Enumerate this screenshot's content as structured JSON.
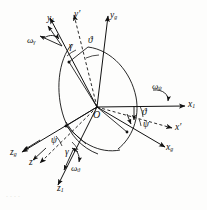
{
  "figure": {
    "domain": "diagram",
    "kind": "euler-angle-coordinate-systems",
    "background_color": "#fdfdfc",
    "ink_color": "#111111",
    "origin_label": "O",
    "bleed_text": "...."
  },
  "axes": [
    {
      "id": "y1",
      "base": "y",
      "sub": "1",
      "prime": false,
      "style": "solid",
      "group": "body",
      "label": "y"
    },
    {
      "id": "yp",
      "base": "y",
      "sub": "",
      "prime": true,
      "style": "dashed",
      "group": "intermediate",
      "label": "y"
    },
    {
      "id": "yg",
      "base": "y",
      "sub": "g",
      "prime": false,
      "style": "solid",
      "group": "ground",
      "label": "y"
    },
    {
      "id": "x1",
      "base": "x",
      "sub": "1",
      "prime": false,
      "style": "solid",
      "group": "body",
      "label": "x"
    },
    {
      "id": "xp",
      "base": "x",
      "sub": "",
      "prime": true,
      "style": "dashed",
      "group": "intermediate",
      "label": "x"
    },
    {
      "id": "xg",
      "base": "x",
      "sub": "g",
      "prime": false,
      "style": "solid",
      "group": "ground",
      "label": "x"
    },
    {
      "id": "z1",
      "base": "z",
      "sub": "1",
      "prime": false,
      "style": "solid",
      "group": "body",
      "label": "z"
    },
    {
      "id": "zp",
      "base": "z",
      "sub": "",
      "prime": true,
      "style": "dashed",
      "group": "intermediate",
      "label": "z"
    },
    {
      "id": "zg",
      "base": "z",
      "sub": "g",
      "prime": false,
      "style": "solid",
      "group": "ground",
      "label": "z"
    }
  ],
  "axis_labels": {
    "y1": "y",
    "y1_sub": "1",
    "yp": "y′",
    "yp_sub": "",
    "yg": "y",
    "yg_sub": "g",
    "x1": "x",
    "x1_sub": "1",
    "xp": "x′",
    "xp_sub": "",
    "xg": "x",
    "xg_sub": "g",
    "z1": "z",
    "z1_sub": "1",
    "zp": "z′",
    "zp_sub": "",
    "zg": "z",
    "zg_sub": "g"
  },
  "angular_velocities": [
    {
      "id": "omega_gamma",
      "symbol": "ω",
      "sub": "γ",
      "about": "y1",
      "position": "upper-left"
    },
    {
      "id": "omega_psi",
      "symbol": "ω",
      "sub": "ψ",
      "about": "x1",
      "position": "right"
    },
    {
      "id": "omega_theta",
      "symbol": "ω",
      "sub": "ϑ",
      "about": "z1",
      "position": "lower-left"
    }
  ],
  "omega_labels": {
    "gamma": {
      "symbol": "ω",
      "sub": "γ"
    },
    "psi": {
      "symbol": "ω",
      "sub": "ψ"
    },
    "theta": {
      "symbol": "ω",
      "sub": "ϑ"
    }
  },
  "angles": [
    {
      "id": "gamma-top",
      "symbol": "γ",
      "name": "roll",
      "location": "upper-left"
    },
    {
      "id": "theta-top",
      "symbol": "ϑ",
      "name": "pitch",
      "location": "upper-center"
    },
    {
      "id": "theta-right",
      "symbol": "ϑ",
      "name": "pitch",
      "location": "mid-right"
    },
    {
      "id": "psi-right",
      "symbol": "ψ",
      "name": "yaw",
      "location": "mid-right"
    },
    {
      "id": "psi-bottom",
      "symbol": "ψ",
      "name": "yaw",
      "location": "lower-left"
    },
    {
      "id": "gamma-bottom",
      "symbol": "γ",
      "name": "roll",
      "location": "lower-center"
    }
  ],
  "angle_labels": {
    "gamma_top": "γ",
    "theta_top": "ϑ",
    "theta_right": "ϑ",
    "psi_right": "ψ",
    "psi_bottom": "ψ",
    "gamma_bottom": "γ"
  }
}
